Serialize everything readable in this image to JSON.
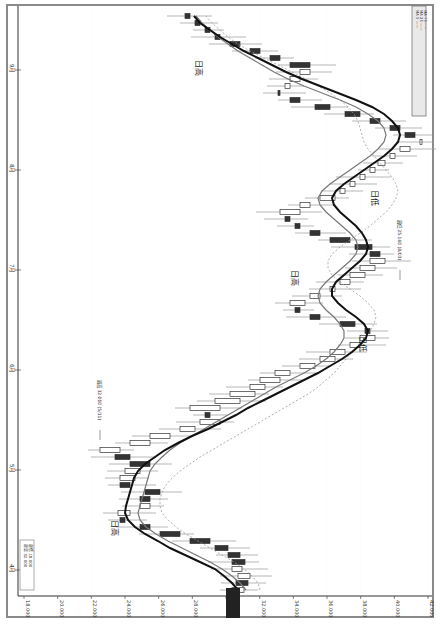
{
  "chart_data": {
    "type": "candlestick",
    "orientation": "rotated-90-clockwise",
    "title": "",
    "price_axis": {
      "label": "",
      "ticks": [
        "18.000",
        "20.000",
        "22.000",
        "24.000",
        "26.000",
        "28.000",
        "30.000",
        "32.000",
        "34.000",
        "36.000",
        "38.000",
        "40.000",
        "42.000"
      ],
      "highlighted_value": "29.000"
    },
    "time_axis": {
      "ticks": [
        "4月",
        "5月",
        "6月",
        "7月",
        "8月",
        "9月"
      ]
    },
    "series": [
      {
        "name": "MA short (gray)",
        "style": "solid-gray"
      },
      {
        "name": "MA long (black, thick)",
        "style": "solid-black"
      },
      {
        "name": "MA dotted",
        "style": "dotted-gray"
      }
    ],
    "annotations": [
      {
        "text": "日高",
        "position": "early low turn"
      },
      {
        "text": "日高",
        "position": "mid peak"
      },
      {
        "text": "日低",
        "position": "trough 1"
      },
      {
        "text": "日低",
        "position": "trough 2"
      },
      {
        "text": "日高",
        "position": "late peak"
      }
    ],
    "callouts": [
      {
        "text": "最高 32.000 (5/11)"
      },
      {
        "text": "最低 25.160 (8/03)"
      }
    ],
    "candles_x": [
      590,
      583,
      576,
      569,
      562,
      555,
      548,
      541,
      534,
      527,
      520,
      513,
      506,
      499,
      492,
      485,
      478,
      471,
      464,
      457,
      450,
      443,
      436,
      429,
      422,
      415,
      408,
      401,
      394,
      387,
      380,
      373,
      366,
      359,
      352,
      345,
      338,
      331,
      324,
      317,
      310,
      303,
      296,
      289,
      282,
      275,
      268,
      261,
      254,
      247,
      240,
      233,
      226,
      219,
      212,
      205,
      198,
      191,
      184,
      177,
      170,
      163,
      156,
      149,
      142,
      135,
      128,
      121,
      114,
      107,
      100,
      93,
      86,
      79,
      72,
      65,
      58,
      51,
      44,
      37,
      30,
      23,
      16
    ],
    "open": [
      232,
      248,
      238,
      232,
      245,
      240,
      228,
      210,
      180,
      150,
      125,
      118,
      140,
      150,
      160,
      130,
      120,
      125,
      150,
      130,
      100,
      130,
      150,
      180,
      200,
      210,
      190,
      215,
      230,
      250,
      260,
      275,
      300,
      320,
      330,
      350,
      360,
      370,
      355,
      320,
      300,
      290,
      310,
      330,
      340,
      350,
      360,
      370,
      380,
      372,
      350,
      320,
      300,
      290,
      280,
      300,
      320,
      340,
      350,
      360,
      370,
      378,
      390,
      400,
      420,
      415,
      400,
      380,
      360,
      330,
      300,
      280,
      285,
      290,
      300,
      310,
      280,
      260,
      240,
      220,
      210,
      200,
      190
    ],
    "close": [
      244,
      236,
      250,
      242,
      232,
      228,
      215,
      190,
      160,
      140,
      120,
      130,
      150,
      140,
      145,
      120,
      135,
      140,
      130,
      115,
      120,
      150,
      170,
      195,
      220,
      205,
      220,
      240,
      255,
      265,
      280,
      290,
      315,
      335,
      345,
      360,
      375,
      365,
      340,
      310,
      295,
      305,
      320,
      335,
      350,
      365,
      375,
      385,
      370,
      355,
      330,
      310,
      295,
      285,
      300,
      310,
      335,
      345,
      355,
      365,
      375,
      385,
      395,
      410,
      420,
      405,
      390,
      370,
      345,
      315,
      290,
      278,
      290,
      300,
      310,
      290,
      270,
      250,
      230,
      215,
      205,
      195,
      185
    ],
    "ma_black": [
      238,
      232,
      224,
      215,
      200,
      185,
      170,
      158,
      145,
      135,
      128,
      125,
      126,
      128,
      130,
      132,
      134,
      138,
      145,
      155,
      165,
      178,
      192,
      208,
      222,
      236,
      248,
      262,
      276,
      290,
      304,
      318,
      330,
      342,
      352,
      360,
      366,
      368,
      364,
      356,
      346,
      338,
      332,
      332,
      336,
      344,
      352,
      360,
      366,
      368,
      366,
      362,
      356,
      348,
      340,
      334,
      332,
      336,
      344,
      354,
      364,
      374,
      384,
      392,
      398,
      400,
      398,
      392,
      384,
      372,
      356,
      338,
      320,
      302,
      286,
      272,
      258,
      244,
      232,
      220,
      210,
      200,
      194
    ],
    "ma_gray": [
      246,
      240,
      232,
      222,
      210,
      196,
      182,
      168,
      156,
      146,
      140,
      138,
      140,
      142,
      144,
      146,
      148,
      150,
      155,
      162,
      170,
      180,
      192,
      204,
      216,
      228,
      240,
      252,
      264,
      276,
      290,
      304,
      316,
      326,
      334,
      340,
      344,
      344,
      340,
      334,
      326,
      320,
      318,
      320,
      326,
      334,
      342,
      350,
      356,
      358,
      356,
      350,
      342,
      334,
      326,
      320,
      318,
      322,
      330,
      340,
      350,
      360,
      370,
      378,
      384,
      386,
      384,
      378,
      368,
      356,
      340,
      322,
      304,
      288,
      274,
      262,
      250,
      238,
      228,
      218,
      210,
      202,
      196
    ],
    "ma_dotted": [
      260,
      258,
      252,
      244,
      234,
      222,
      210,
      198,
      186,
      176,
      168,
      162,
      160,
      160,
      162,
      166,
      172,
      180,
      190,
      200,
      212,
      224,
      236,
      248,
      260,
      272,
      284,
      296,
      308,
      318,
      326,
      334,
      340,
      346,
      352,
      358,
      364,
      370,
      374,
      376,
      374,
      368,
      360,
      350,
      340,
      332,
      328,
      328,
      332,
      340,
      350,
      360,
      370,
      378,
      386,
      392,
      396,
      398,
      396,
      392,
      386,
      380,
      374,
      368,
      364,
      362,
      360,
      358,
      354,
      348,
      340,
      330,
      318,
      306,
      292,
      278,
      264,
      250,
      238,
      228,
      220,
      212,
      206
    ]
  },
  "frame": {
    "border_color": "#8a8a8a",
    "candle_color": "#333333",
    "wick_color": "#999999",
    "ma_black_color": "#111111",
    "ma_gray_color": "#777777",
    "ma_dotted_color": "#999999",
    "highlight_box_color": "#222222"
  },
  "legend": {
    "lines": [
      "MA 5 ——",
      "MA 25 ——",
      "MA 75 ·····"
    ]
  },
  "info_box": {
    "lines": [
      "最高 32.000",
      "最低 18.000"
    ]
  }
}
